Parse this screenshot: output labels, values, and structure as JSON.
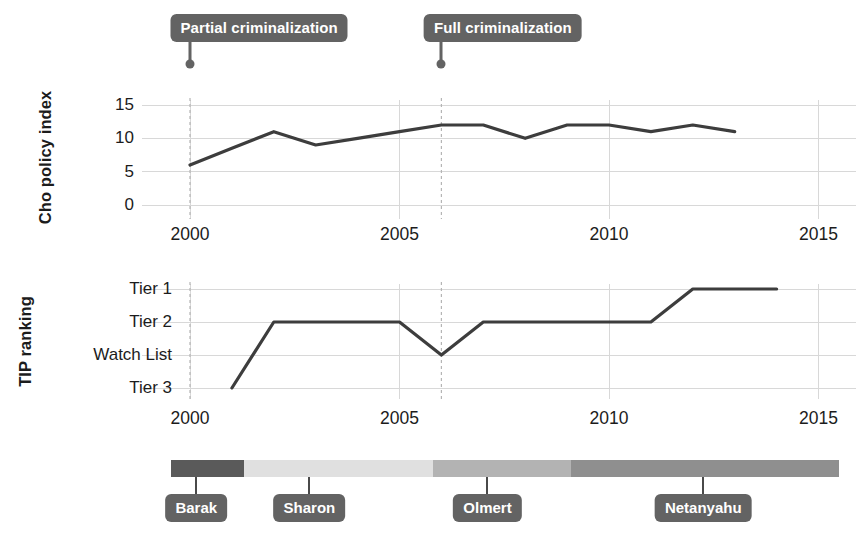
{
  "figure": {
    "width": 864,
    "height": 540,
    "background": "#ffffff",
    "line_color": "#3d3d3d",
    "grid_color": "#d8d8d8",
    "event_line_color": "#bdbdbd",
    "label_bg_color": "#636363",
    "label_text_color": "#ffffff",
    "text_color": "#1c1c1c"
  },
  "annotations": [
    {
      "label": "Partial criminalization",
      "year": 2000
    },
    {
      "label": "Full criminalization",
      "year": 2006
    }
  ],
  "prime_ministers": {
    "labels": [
      "Barak",
      "Sharon",
      "Olmert",
      "Netanyahu"
    ],
    "segments": [
      {
        "name": "Barak",
        "start_year": 1999.55,
        "end_year": 2001.3,
        "color": "#5a5a5a",
        "label_year": 2000.15
      },
      {
        "name": "Sharon",
        "start_year": 2001.3,
        "end_year": 2005.8,
        "color": "#e0e0e0",
        "label_year": 2002.85
      },
      {
        "name": "Olmert",
        "start_year": 2005.8,
        "end_year": 2009.1,
        "color": "#b3b3b3",
        "label_year": 2007.1
      },
      {
        "name": "Netanyahu",
        "start_year": 2009.1,
        "end_year": 2015.5,
        "color": "#8f8f8f",
        "label_year": 2012.25
      }
    ]
  },
  "chart_data": [
    {
      "type": "line",
      "title": "",
      "ylabel": "Cho policy index",
      "xlabel": "",
      "grid": true,
      "legend": "none",
      "xlim": [
        1999.0,
        2015.9
      ],
      "ylim": [
        -1.5,
        16.5
      ],
      "xticks": [
        2000,
        2005,
        2010,
        2015
      ],
      "xtick_labels": [
        "2000",
        "2005",
        "2010",
        "2015"
      ],
      "yticks": [
        0,
        5,
        10,
        15
      ],
      "ytick_labels": [
        "0",
        "5",
        "10",
        "15"
      ],
      "series": [
        {
          "name": "Cho policy index",
          "x": [
            2000,
            2001,
            2002,
            2003,
            2004,
            2005,
            2006,
            2007,
            2008,
            2009,
            2010,
            2011,
            2012,
            2013
          ],
          "values": [
            6,
            8.5,
            11,
            9,
            10,
            11,
            12,
            12,
            10,
            12,
            12,
            11,
            12,
            11
          ]
        }
      ]
    },
    {
      "type": "line",
      "title": "",
      "ylabel": "TIP ranking",
      "xlabel": "",
      "grid": true,
      "legend": "none",
      "xlim": [
        1999.0,
        2015.9
      ],
      "ylim": [
        0.5,
        4.5
      ],
      "xticks": [
        2000,
        2005,
        2010,
        2015
      ],
      "xtick_labels": [
        "2000",
        "2005",
        "2010",
        "2015"
      ],
      "yticks": [
        4,
        3,
        2,
        1
      ],
      "ytick_labels": [
        "Tier 1",
        "Tier 2",
        "Watch List",
        "Tier 3"
      ],
      "ytick_values": [
        4,
        3,
        2,
        1
      ],
      "series": [
        {
          "name": "TIP ranking",
          "x": [
            2001,
            2002,
            2003,
            2004,
            2005,
            2006,
            2007,
            2008,
            2009,
            2010,
            2011,
            2012,
            2013,
            2014
          ],
          "values": [
            1,
            3,
            3,
            3,
            3,
            2,
            3,
            3,
            3,
            3,
            3,
            4,
            4,
            4
          ],
          "value_labels": [
            "Tier 3",
            "Tier 2",
            "Tier 2",
            "Tier 2",
            "Tier 2",
            "Watch List",
            "Tier 2",
            "Tier 2",
            "Tier 2",
            "Tier 2",
            "Tier 2",
            "Tier 1",
            "Tier 1",
            "Tier 1"
          ]
        }
      ]
    }
  ]
}
